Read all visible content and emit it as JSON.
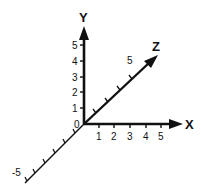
{
  "diagram": {
    "type": "3d-coordinate-axes",
    "origin_label": "0",
    "line_color": "#111111",
    "background": "#ffffff",
    "axes": {
      "x": {
        "name": "X",
        "ticks": [
          "1",
          "2",
          "3",
          "4",
          "5"
        ]
      },
      "y": {
        "name": "Y",
        "ticks": [
          "1",
          "2",
          "3",
          "4",
          "5"
        ]
      },
      "z": {
        "name": "Z",
        "positive_label": "5",
        "negative_label": "-5"
      }
    }
  }
}
